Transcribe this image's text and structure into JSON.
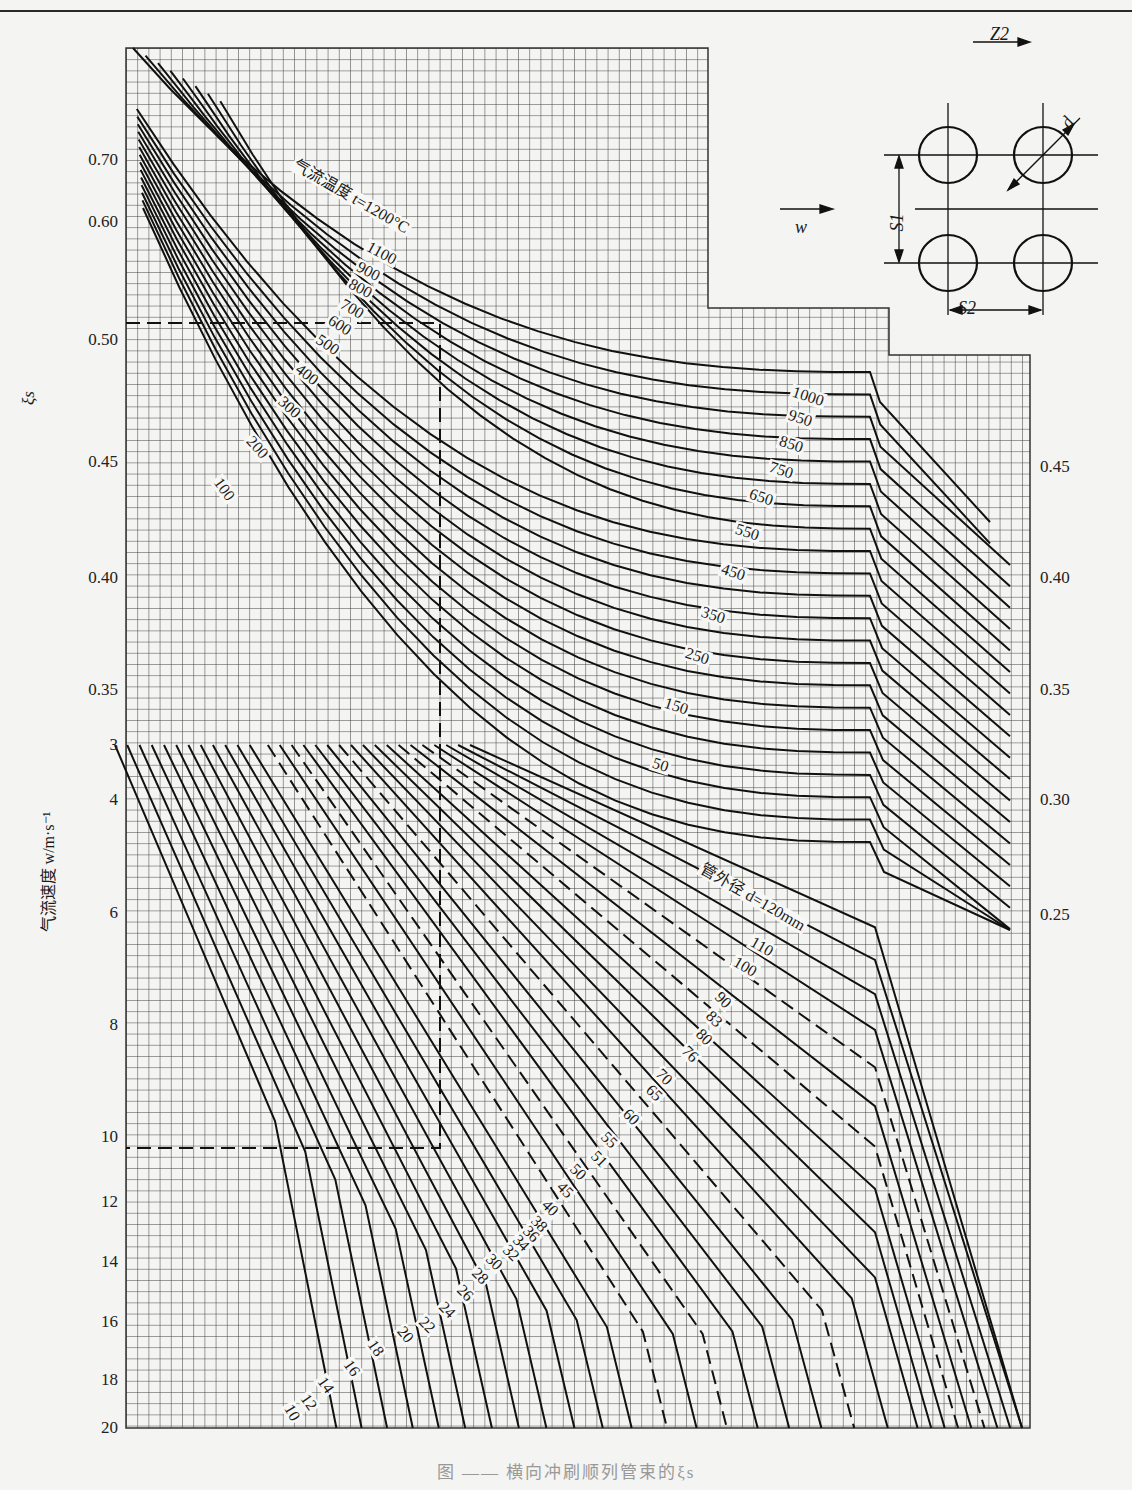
{
  "caption": "图 —— 横向冲刷顺列管束的ξs",
  "diagram": {
    "flow_label": "w",
    "z2_label": "Z2",
    "s1_label": "S1",
    "s2_label": "S2",
    "d_label": "d"
  },
  "axes": {
    "xi_label": "ξs",
    "w_label": "气流速度 w/m·s⁻¹"
  },
  "chart_data": {
    "type": "line",
    "upper_panel": {
      "ylabel": "ξs",
      "left_ticks": [
        0.7,
        0.6,
        0.5,
        0.45,
        0.4,
        0.35
      ],
      "right_ticks": [
        0.45,
        0.4,
        0.35,
        0.3,
        0.25
      ],
      "family_label": "气流温度 t=1200°C",
      "temperature_series_C": [
        1200,
        1100,
        1000,
        950,
        900,
        850,
        800,
        750,
        700,
        650,
        600,
        550,
        500,
        450,
        400,
        350,
        300,
        250,
        200,
        150,
        100,
        50
      ],
      "grid": true
    },
    "lower_panel": {
      "ylabel": "气流速度 w/m·s⁻¹",
      "ticks": [
        3,
        4,
        6,
        8,
        10,
        12,
        14,
        16,
        18,
        20
      ],
      "ylim": [
        3,
        20
      ],
      "family_label": "管外径 d=120mm",
      "diameter_series_mm": [
        120,
        110,
        100,
        90,
        83,
        80,
        76,
        70,
        65,
        60,
        55,
        51,
        50,
        45,
        40,
        38,
        36,
        34,
        32,
        30,
        28,
        26,
        24,
        22,
        20,
        18,
        16,
        14,
        12,
        10
      ],
      "dashed_series_mm": [
        83,
        76,
        51,
        38,
        34
      ],
      "grid": true
    }
  },
  "ticks_left_upper": [
    {
      "label": "0.70",
      "y": 160
    },
    {
      "label": "0.60",
      "y": 222
    },
    {
      "label": "0.50",
      "y": 340
    },
    {
      "label": "0.45",
      "y": 462
    },
    {
      "label": "0.40",
      "y": 578
    },
    {
      "label": "0.35",
      "y": 690
    }
  ],
  "ticks_right_upper": [
    {
      "label": "0.45",
      "y": 467
    },
    {
      "label": "0.40",
      "y": 578
    },
    {
      "label": "0.35",
      "y": 690
    },
    {
      "label": "0.30",
      "y": 800
    },
    {
      "label": "0.25",
      "y": 915
    }
  ],
  "ticks_left_lower": [
    {
      "label": "3",
      "y": 745
    },
    {
      "label": "4",
      "y": 800
    },
    {
      "label": "6",
      "y": 913
    },
    {
      "label": "8",
      "y": 1025
    },
    {
      "label": "10",
      "y": 1137
    },
    {
      "label": "12",
      "y": 1202
    },
    {
      "label": "14",
      "y": 1262
    },
    {
      "label": "16",
      "y": 1322
    },
    {
      "label": "18",
      "y": 1380
    },
    {
      "label": "20",
      "y": 1428
    }
  ],
  "temp_labels": [
    {
      "text": "气流温度 t=1200°C",
      "x": 293,
      "y": 163,
      "rot": 30
    },
    {
      "text": "1100",
      "x": 366,
      "y": 245,
      "rot": 28
    },
    {
      "text": "900",
      "x": 356,
      "y": 265,
      "rot": 28
    },
    {
      "text": "800",
      "x": 348,
      "y": 282,
      "rot": 28
    },
    {
      "text": "700",
      "x": 340,
      "y": 302,
      "rot": 30
    },
    {
      "text": "600",
      "x": 328,
      "y": 318,
      "rot": 32
    },
    {
      "text": "500",
      "x": 316,
      "y": 337,
      "rot": 34
    },
    {
      "text": "400",
      "x": 296,
      "y": 366,
      "rot": 38
    },
    {
      "text": "300",
      "x": 279,
      "y": 398,
      "rot": 42
    },
    {
      "text": "200",
      "x": 248,
      "y": 437,
      "rot": 48
    },
    {
      "text": "100",
      "x": 216,
      "y": 478,
      "rot": 54
    },
    {
      "text": "1000",
      "x": 791,
      "y": 391,
      "rot": 18
    },
    {
      "text": "950",
      "x": 787,
      "y": 414,
      "rot": 18
    },
    {
      "text": "850",
      "x": 778,
      "y": 440,
      "rot": 18
    },
    {
      "text": "750",
      "x": 768,
      "y": 466,
      "rot": 18
    },
    {
      "text": "650",
      "x": 748,
      "y": 493,
      "rot": 18
    },
    {
      "text": "550",
      "x": 734,
      "y": 528,
      "rot": 18
    },
    {
      "text": "450",
      "x": 720,
      "y": 568,
      "rot": 18
    },
    {
      "text": "350",
      "x": 700,
      "y": 611,
      "rot": 18
    },
    {
      "text": "250",
      "x": 684,
      "y": 652,
      "rot": 18
    },
    {
      "text": "150",
      "x": 663,
      "y": 702,
      "rot": 18
    },
    {
      "text": "50",
      "x": 651,
      "y": 762,
      "rot": 18
    }
  ],
  "diam_labels": [
    {
      "text": "管外径 d=120mm",
      "x": 700,
      "y": 867,
      "rot": 30
    },
    {
      "text": "110",
      "x": 750,
      "y": 940,
      "rot": 30
    },
    {
      "text": "100",
      "x": 733,
      "y": 960,
      "rot": 30
    },
    {
      "text": "90",
      "x": 716,
      "y": 993,
      "rot": 45
    },
    {
      "text": "83",
      "x": 707,
      "y": 1012,
      "rot": 45
    },
    {
      "text": "80",
      "x": 697,
      "y": 1030,
      "rot": 45
    },
    {
      "text": "76",
      "x": 683,
      "y": 1047,
      "rot": 45
    },
    {
      "text": "70",
      "x": 657,
      "y": 1070,
      "rot": 45
    },
    {
      "text": "65",
      "x": 647,
      "y": 1086,
      "rot": 45
    },
    {
      "text": "60",
      "x": 624,
      "y": 1110,
      "rot": 45
    },
    {
      "text": "55",
      "x": 602,
      "y": 1133,
      "rot": 45
    },
    {
      "text": "51",
      "x": 592,
      "y": 1152,
      "rot": 45
    },
    {
      "text": "50",
      "x": 571,
      "y": 1165,
      "rot": 45
    },
    {
      "text": "45",
      "x": 558,
      "y": 1183,
      "rot": 45
    },
    {
      "text": "40",
      "x": 543,
      "y": 1201,
      "rot": 45
    },
    {
      "text": "38",
      "x": 532,
      "y": 1217,
      "rot": 45
    },
    {
      "text": "36",
      "x": 524,
      "y": 1227,
      "rot": 45
    },
    {
      "text": "34",
      "x": 514,
      "y": 1236,
      "rot": 45
    },
    {
      "text": "32",
      "x": 504,
      "y": 1246,
      "rot": 45
    },
    {
      "text": "30",
      "x": 487,
      "y": 1255,
      "rot": 45
    },
    {
      "text": "28",
      "x": 473,
      "y": 1269,
      "rot": 45
    },
    {
      "text": "26",
      "x": 458,
      "y": 1286,
      "rot": 45
    },
    {
      "text": "24",
      "x": 440,
      "y": 1303,
      "rot": 45
    },
    {
      "text": "22",
      "x": 420,
      "y": 1318,
      "rot": 45
    },
    {
      "text": "20",
      "x": 399,
      "y": 1327,
      "rot": 50
    },
    {
      "text": "18",
      "x": 370,
      "y": 1340,
      "rot": 55
    },
    {
      "text": "16",
      "x": 346,
      "y": 1360,
      "rot": 55
    },
    {
      "text": "14",
      "x": 320,
      "y": 1377,
      "rot": 55
    },
    {
      "text": "12",
      "x": 303,
      "y": 1394,
      "rot": 55
    },
    {
      "text": "10",
      "x": 287,
      "y": 1404,
      "rot": 60
    }
  ]
}
